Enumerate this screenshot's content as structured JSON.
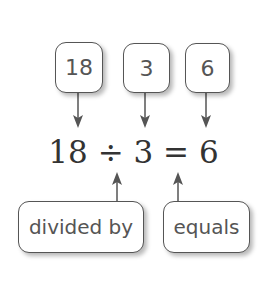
{
  "top_labels": [
    {
      "text": "18",
      "points_to": "dividend"
    },
    {
      "text": "3",
      "points_to": "divisor"
    },
    {
      "text": "6",
      "points_to": "quotient"
    }
  ],
  "equation": "18 ÷ 3 = 6",
  "bottom_labels": [
    {
      "text": "divided by",
      "points_to": "÷"
    },
    {
      "text": "equals",
      "points_to": "="
    }
  ],
  "colors": {
    "stroke": "#555555",
    "text": "#333333",
    "background": "#ffffff"
  }
}
